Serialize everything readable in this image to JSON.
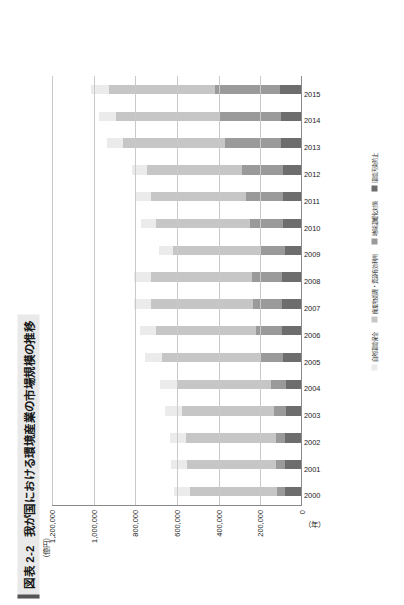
{
  "figure": {
    "number": "図表 2-2",
    "title": "我が国における環境産業の市場規模の推移"
  },
  "axes": {
    "y_unit": "（億円）",
    "x_unit": "（年）"
  },
  "colors": {
    "seg1": "#6d6d6d",
    "seg2": "#9a9a9a",
    "seg3": "#c6c6c6",
    "seg4": "#ebebeb",
    "gridline": "#c9c9c9",
    "axis": "#8a8a8a",
    "title_bg": "#e9e9e9",
    "title_rule": "#555555"
  },
  "chart_data": {
    "type": "bar",
    "stacked": true,
    "title": "我が国における環境産業の市場規模の推移",
    "xlabel": "（年）",
    "ylabel": "（億円）",
    "ylim": [
      0,
      1200000
    ],
    "yticks": [
      0,
      200000,
      400000,
      600000,
      800000,
      1000000,
      1200000
    ],
    "ytick_labels": [
      "0",
      "200,000",
      "400,000",
      "600,000",
      "800,000",
      "1,000,000",
      "1,200,000"
    ],
    "grid": true,
    "legend_position": "right",
    "categories": [
      "2000",
      "2001",
      "2002",
      "2003",
      "2004",
      "2005",
      "2006",
      "2007",
      "2008",
      "2009",
      "2010",
      "2011",
      "2012",
      "2013",
      "2014",
      "2015"
    ],
    "series": [
      {
        "name": "環境汚染防止",
        "color": "#6d6d6d",
        "values": [
          75000,
          76000,
          75000,
          74000,
          73000,
          87000,
          89000,
          90000,
          89000,
          77000,
          86000,
          88000,
          86000,
          96000,
          98000,
          103000
        ]
      },
      {
        "name": "地球温暖化対策",
        "color": "#9a9a9a",
        "values": [
          40000,
          43000,
          46000,
          55000,
          71000,
          110000,
          125000,
          140000,
          146000,
          122000,
          158000,
          178000,
          196000,
          270000,
          292000,
          310000
        ]
      },
      {
        "name": "廃棄物処理・資源有効利用",
        "color": "#c6c6c6",
        "values": [
          420000,
          428000,
          430000,
          443000,
          450000,
          471000,
          480000,
          490000,
          486000,
          415000,
          450000,
          455000,
          455000,
          487000,
          498000,
          510000
        ]
      },
      {
        "name": "自然環境保全",
        "color": "#ebebeb",
        "values": [
          77000,
          76000,
          77000,
          80000,
          82000,
          80000,
          81000,
          82000,
          81000,
          70000,
          73000,
          74000,
          74000,
          79000,
          81000,
          84000
        ]
      }
    ],
    "totals": [
      612000,
      623000,
      628000,
      652000,
      676000,
      748000,
      775000,
      802000,
      802000,
      684000,
      767000,
      795000,
      811000,
      932000,
      969000,
      1007000
    ]
  },
  "legend": {
    "items": [
      {
        "label": "環境汚染防止",
        "color": "#6d6d6d"
      },
      {
        "label": "地球温暖化対策",
        "color": "#9a9a9a"
      },
      {
        "label": "廃棄物処理・資源有効利用",
        "color": "#c6c6c6"
      },
      {
        "label": "自然環境保全",
        "color": "#ebebeb"
      }
    ]
  }
}
